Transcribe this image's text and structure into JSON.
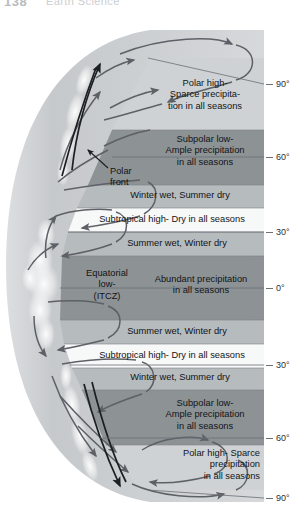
{
  "page_header": {
    "folio": "138",
    "running_head": "Earth Science"
  },
  "figure": {
    "colors": {
      "band_dark": "#8e9296",
      "band_medium": "#b7bbbe",
      "band_light": "#cfd2d4",
      "band_white": "#f7f8f8",
      "globe_body": "#c9ccce",
      "globe_edge": "#dfe1e2",
      "cloud": "#f2f3f3",
      "arrow": "#5d6066",
      "arrow_dark": "#1b1e22",
      "axis": "#6b7076",
      "text": "#111418"
    },
    "latitude_axis": {
      "unit": "degrees",
      "ticks": [
        {
          "label": "90°",
          "value": 90,
          "hemisphere": "north",
          "y": 64
        },
        {
          "label": "60°",
          "value": 60,
          "hemisphere": "north",
          "y": 137
        },
        {
          "label": "30°",
          "value": 30,
          "hemisphere": "north",
          "y": 212
        },
        {
          "label": "0°",
          "value": 0,
          "hemisphere": "equator",
          "y": 268
        },
        {
          "label": "30°",
          "value": -30,
          "hemisphere": "south",
          "y": 345
        },
        {
          "label": "60°",
          "value": -60,
          "hemisphere": "south",
          "y": 418
        },
        {
          "label": "90°",
          "value": -90,
          "hemisphere": "south",
          "y": 478
        }
      ]
    },
    "bands": [
      {
        "id": "polar-high-north",
        "label": "Polar high-\nSparce precipita-\ntion in all seasons",
        "pressure_feature": "Polar high",
        "precipitation": "Sparce precipitation in all seasons",
        "lat_range": "60°N – 90°N",
        "align": "center",
        "shade": "band_light"
      },
      {
        "id": "subpolar-low-north",
        "label": "Subpolar low-\nAmple precipitation\nin all seasons",
        "pressure_feature": "Subpolar low",
        "precipitation": "Ample precipitation in all seasons",
        "lat_range": "40°N – 60°N",
        "align": "center",
        "shade": "band_dark"
      },
      {
        "id": "winter-wet-north",
        "label": "Winter wet, Summer dry",
        "precipitation": "Winter wet, Summer dry",
        "lat_range": "30°N – 40°N",
        "align": "center",
        "shade": "band_medium"
      },
      {
        "id": "subtropical-high-north",
        "label": "Subtropical high- Dry in all seasons",
        "pressure_feature": "Subtropical high",
        "precipitation": "Dry in all seasons",
        "lat_range": "20°N – 30°N",
        "align": "center",
        "shade": "band_white"
      },
      {
        "id": "summer-wet-north",
        "label": "Summer wet, Winter dry",
        "precipitation": "Summer wet, Winter dry",
        "lat_range": "10°N – 20°N",
        "align": "center",
        "shade": "band_medium"
      },
      {
        "id": "equatorial-low",
        "label": "Abundant precipitation\nin all seasons",
        "side_label": "Equatorial\nlow-\n(ITCZ)",
        "pressure_feature": "Equatorial low (ITCZ)",
        "precipitation": "Abundant precipitation in all seasons",
        "lat_range": "10°N – 10°S",
        "align": "center",
        "shade": "band_dark"
      },
      {
        "id": "summer-wet-south",
        "label": "Summer wet, Winter dry",
        "precipitation": "Summer wet, Winter dry",
        "lat_range": "10°S – 20°S",
        "align": "center",
        "shade": "band_medium"
      },
      {
        "id": "subtropical-high-south",
        "label": "Subtropical high- Dry in all seasons",
        "pressure_feature": "Subtropical high",
        "precipitation": "Dry in all seasons",
        "lat_range": "20°S – 30°S",
        "align": "center",
        "shade": "band_white"
      },
      {
        "id": "winter-wet-south",
        "label": "Winter wet, Summer dry",
        "precipitation": "Winter wet, Summer dry",
        "lat_range": "30°S – 40°S",
        "align": "center",
        "shade": "band_medium"
      },
      {
        "id": "subpolar-low-south",
        "label": "Subpolar low-\nAmple precipitation\nin all seasons",
        "pressure_feature": "Subpolar low",
        "precipitation": "Ample precipitation in all seasons",
        "lat_range": "40°S – 60°S",
        "align": "center",
        "shade": "band_dark"
      },
      {
        "id": "polar-high-south",
        "label": "Polar high- Sparce\nprecipitation\nin all seasons",
        "pressure_feature": "Polar high",
        "precipitation": "Sparce precipitation in all seasons",
        "lat_range": "60°S – 90°S",
        "align": "right",
        "shade": "band_light"
      }
    ],
    "annotations": [
      {
        "id": "polar-front",
        "label": "Polar\nfront",
        "description": "Boundary where polar easterlies meet mid-latitude westerlies"
      }
    ]
  }
}
